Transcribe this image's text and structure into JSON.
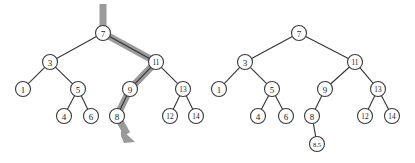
{
  "figure": {
    "width": 415,
    "height": 163,
    "background": "#ffffff",
    "edge_color": "#333333",
    "node_stroke_color": "#3a3a3a",
    "node_fill_color": "#ffffff",
    "highlight_color": "#9a9a9a"
  },
  "panels": [
    {
      "id": "before",
      "caption": "",
      "tree": {
        "nodes": [
          {
            "id": "L7",
            "label": "7",
            "x": 103,
            "y": 33,
            "r": 7.5,
            "size": "normal"
          },
          {
            "id": "L3",
            "label": "3",
            "x": 50,
            "y": 62,
            "r": 7.5,
            "size": "normal"
          },
          {
            "id": "L11",
            "label": "11",
            "x": 156,
            "y": 62,
            "r": 7.5,
            "size": "small"
          },
          {
            "id": "L1",
            "label": "1",
            "x": 23,
            "y": 89,
            "r": 7.5,
            "size": "normal"
          },
          {
            "id": "L5",
            "label": "5",
            "x": 78,
            "y": 89,
            "r": 7.5,
            "size": "normal"
          },
          {
            "id": "L9",
            "label": "9",
            "x": 130,
            "y": 89,
            "r": 7.5,
            "size": "normal"
          },
          {
            "id": "L13",
            "label": "13",
            "x": 183,
            "y": 89,
            "r": 7.5,
            "size": "small"
          },
          {
            "id": "L4",
            "label": "4",
            "x": 64,
            "y": 116,
            "r": 7.5,
            "size": "normal"
          },
          {
            "id": "L6",
            "label": "6",
            "x": 91,
            "y": 116,
            "r": 7.5,
            "size": "normal"
          },
          {
            "id": "L8",
            "label": "8",
            "x": 117,
            "y": 116,
            "r": 7.5,
            "size": "normal"
          },
          {
            "id": "L12",
            "label": "12",
            "x": 170,
            "y": 116,
            "r": 7.5,
            "size": "small"
          },
          {
            "id": "L14",
            "label": "14",
            "x": 196,
            "y": 116,
            "r": 7.5,
            "size": "small"
          }
        ],
        "edges": [
          {
            "from": "L7",
            "to": "L3"
          },
          {
            "from": "L7",
            "to": "L11"
          },
          {
            "from": "L3",
            "to": "L1"
          },
          {
            "from": "L3",
            "to": "L5"
          },
          {
            "from": "L5",
            "to": "L4"
          },
          {
            "from": "L5",
            "to": "L6"
          },
          {
            "from": "L11",
            "to": "L9"
          },
          {
            "from": "L11",
            "to": "L13"
          },
          {
            "from": "L9",
            "to": "L8"
          },
          {
            "from": "L13",
            "to": "L12"
          },
          {
            "from": "L13",
            "to": "L14"
          }
        ],
        "highlight_path": {
          "description": "search path for insertion: enters at root 7, goes right to 11, left to 9, left to 8, then down-right to the empty child slot",
          "visited_nodes": [
            "7",
            "11",
            "9",
            "8"
          ],
          "points": "103,4 103,33 156,62 130,89 117,116 127,134",
          "arrow": "121,129 135,142 124,143 121,136"
        }
      }
    },
    {
      "id": "after",
      "caption": "",
      "tree": {
        "nodes": [
          {
            "id": "R7",
            "label": "7",
            "x": 299,
            "y": 33,
            "r": 7.5,
            "size": "normal"
          },
          {
            "id": "R3",
            "label": "3",
            "x": 245,
            "y": 62,
            "r": 7.5,
            "size": "normal"
          },
          {
            "id": "R11",
            "label": "11",
            "x": 355,
            "y": 62,
            "r": 7.5,
            "size": "small"
          },
          {
            "id": "R1",
            "label": "1",
            "x": 219,
            "y": 89,
            "r": 7.5,
            "size": "normal"
          },
          {
            "id": "R5",
            "label": "5",
            "x": 272,
            "y": 89,
            "r": 7.5,
            "size": "normal"
          },
          {
            "id": "R9",
            "label": "9",
            "x": 325,
            "y": 89,
            "r": 7.5,
            "size": "normal"
          },
          {
            "id": "R13",
            "label": "13",
            "x": 378,
            "y": 89,
            "r": 7.5,
            "size": "small"
          },
          {
            "id": "R4",
            "label": "4",
            "x": 258,
            "y": 116,
            "r": 7.5,
            "size": "normal"
          },
          {
            "id": "R6",
            "label": "6",
            "x": 286,
            "y": 116,
            "r": 7.5,
            "size": "normal"
          },
          {
            "id": "R8",
            "label": "8",
            "x": 312,
            "y": 116,
            "r": 7.5,
            "size": "normal"
          },
          {
            "id": "R12",
            "label": "12",
            "x": 365,
            "y": 116,
            "r": 7.5,
            "size": "small"
          },
          {
            "id": "R14",
            "label": "14",
            "x": 392,
            "y": 116,
            "r": 7.5,
            "size": "small"
          },
          {
            "id": "R85",
            "label": "8.5",
            "x": 317,
            "y": 144,
            "r": 7.5,
            "size": "tiny"
          }
        ],
        "edges": [
          {
            "from": "R7",
            "to": "R3"
          },
          {
            "from": "R7",
            "to": "R11"
          },
          {
            "from": "R3",
            "to": "R1"
          },
          {
            "from": "R3",
            "to": "R5"
          },
          {
            "from": "R5",
            "to": "R4"
          },
          {
            "from": "R5",
            "to": "R6"
          },
          {
            "from": "R11",
            "to": "R9"
          },
          {
            "from": "R11",
            "to": "R13"
          },
          {
            "from": "R9",
            "to": "R8"
          },
          {
            "from": "R13",
            "to": "R12"
          },
          {
            "from": "R13",
            "to": "R14"
          },
          {
            "from": "R8",
            "to": "R85"
          }
        ],
        "highlight_path": null,
        "inserted_node": "8.5"
      }
    }
  ]
}
